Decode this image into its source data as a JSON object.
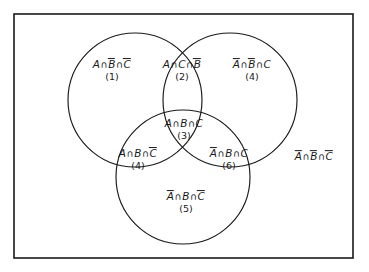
{
  "figure": {
    "type": "venn-3set",
    "background_color": "#ffffff",
    "stroke_color": "#1a1a1a",
    "universe_border": {
      "x": 14,
      "y": 14,
      "width": 339,
      "height": 244,
      "stroke_width": 1.6
    },
    "circles": [
      {
        "name": "set-a",
        "label": "A",
        "cx": 135,
        "cy": 100,
        "r": 67
      },
      {
        "name": "set-c",
        "label": "C",
        "cx": 230,
        "cy": 100,
        "r": 67
      },
      {
        "name": "set-b",
        "label": "B",
        "cx": 183,
        "cy": 177,
        "r": 67
      }
    ],
    "regions": [
      {
        "id": "region-1",
        "name": "a-only",
        "expression": "A∩B̄∩C̄",
        "parts": [
          {
            "text": "A",
            "bar": false
          },
          {
            "text": "∩",
            "op": true
          },
          {
            "text": "B",
            "bar": true
          },
          {
            "text": "∩",
            "op": true
          },
          {
            "text": "C",
            "bar": true
          }
        ],
        "count": "(1)",
        "x": 112,
        "y": 71
      },
      {
        "id": "region-2",
        "name": "a-and-c-not-b",
        "expression": "A∩C∩B̄",
        "parts": [
          {
            "text": "A",
            "bar": false
          },
          {
            "text": "∩",
            "op": true
          },
          {
            "text": "C",
            "bar": false
          },
          {
            "text": "∩",
            "op": true
          },
          {
            "text": "B",
            "bar": true
          }
        ],
        "count": "(2)",
        "x": 182,
        "y": 71
      },
      {
        "id": "region-4-top",
        "name": "c-only",
        "expression": "Ā∩B̄∩C",
        "parts": [
          {
            "text": "A",
            "bar": true
          },
          {
            "text": "∩",
            "op": true
          },
          {
            "text": "B",
            "bar": true
          },
          {
            "text": "∩",
            "op": true
          },
          {
            "text": "C",
            "bar": false
          }
        ],
        "count": "(4)",
        "x": 252,
        "y": 71
      },
      {
        "id": "region-3",
        "name": "a-and-b-and-c",
        "expression": "A∩B∩C",
        "parts": [
          {
            "text": "A",
            "bar": false
          },
          {
            "text": "∩",
            "op": true
          },
          {
            "text": "B",
            "bar": false
          },
          {
            "text": "∩",
            "op": true
          },
          {
            "text": "C",
            "bar": false
          }
        ],
        "count": "(3)",
        "x": 184,
        "y": 130
      },
      {
        "id": "region-4-left",
        "name": "a-and-b-not-c",
        "expression": "A∩B∩C̄",
        "parts": [
          {
            "text": "A",
            "bar": false
          },
          {
            "text": "∩",
            "op": true
          },
          {
            "text": "B",
            "bar": false
          },
          {
            "text": "∩",
            "op": true
          },
          {
            "text": "C",
            "bar": true
          }
        ],
        "count": "(4)",
        "x": 138,
        "y": 160
      },
      {
        "id": "region-6",
        "name": "b-and-c-not-a",
        "expression": "Ā∩B∩C",
        "parts": [
          {
            "text": "A",
            "bar": true
          },
          {
            "text": "∩",
            "op": true
          },
          {
            "text": "B",
            "bar": false
          },
          {
            "text": "∩",
            "op": true
          },
          {
            "text": "C",
            "bar": false
          }
        ],
        "count": "(6)",
        "x": 229,
        "y": 160
      },
      {
        "id": "region-5",
        "name": "b-only",
        "expression": "Ā∩B∩C̄",
        "parts": [
          {
            "text": "A",
            "bar": true
          },
          {
            "text": "∩",
            "op": true
          },
          {
            "text": "B",
            "bar": false
          },
          {
            "text": "∩",
            "op": true
          },
          {
            "text": "C",
            "bar": true
          }
        ],
        "count": "(5)",
        "x": 186,
        "y": 203
      },
      {
        "id": "region-outside",
        "name": "outside-all-sets",
        "expression": "Ā∩B̄∩C̄",
        "parts": [
          {
            "text": "A",
            "bar": true
          },
          {
            "text": "∩",
            "op": true
          },
          {
            "text": "B",
            "bar": true
          },
          {
            "text": "∩",
            "op": true
          },
          {
            "text": "C",
            "bar": true
          }
        ],
        "count": "",
        "x": 314,
        "y": 157
      }
    ]
  }
}
